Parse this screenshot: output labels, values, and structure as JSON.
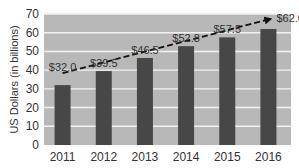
{
  "chart_data": {
    "type": "bar",
    "title": "",
    "xlabel": "",
    "ylabel": "US Dollars (in billions)",
    "categories": [
      "2011",
      "2012",
      "2013",
      "2014",
      "2015",
      "2016"
    ],
    "values": [
      32.0,
      39.5,
      46.5,
      52.8,
      57.5,
      62.0
    ],
    "data_labels": [
      "$32.0",
      "$39.5",
      "$46.5",
      "$52.8",
      "$57.5",
      "$62.0"
    ],
    "ylim": [
      0,
      70
    ],
    "yticks": [
      0,
      10,
      20,
      30,
      40,
      50,
      60,
      70
    ],
    "grid": true,
    "legend": null,
    "annotations": [
      {
        "type": "dashed-trend-arrow",
        "from": "2011",
        "to": "2016"
      }
    ]
  },
  "colors": {
    "bar": "#474747",
    "plot_background": "#b8b8b8",
    "gridline": "#f2f2f2",
    "trend": "#111111"
  }
}
